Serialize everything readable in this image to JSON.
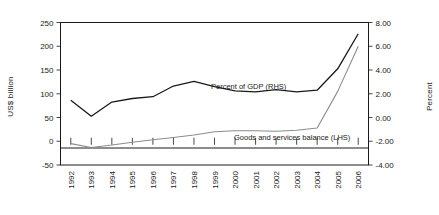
{
  "chart_data": {
    "type": "line",
    "title": "",
    "xlabel": "",
    "ylabel": "US$ billion",
    "ylabel_right": "Percent",
    "grid": false,
    "legend_position": "inline-annotation",
    "x": [
      1992,
      1993,
      1994,
      1995,
      1996,
      1997,
      1998,
      1999,
      2000,
      2001,
      2002,
      2003,
      2004,
      2005,
      2006
    ],
    "categories": [
      "1992",
      "1993",
      "1994",
      "1995",
      "1996",
      "1997",
      "1998",
      "1999",
      "2000",
      "2001",
      "2002",
      "2003",
      "2004",
      "2005",
      "2006"
    ],
    "ylim": [
      -50,
      250
    ],
    "yticks": [
      -50,
      0,
      50,
      100,
      150,
      200,
      250
    ],
    "ytick_labels": [
      "-50",
      "0",
      "50",
      "100",
      "150",
      "200",
      "250"
    ],
    "ylim_right": [
      -4.0,
      8.0
    ],
    "yticks_right": [
      -4.0,
      -2.0,
      0.0,
      2.0,
      4.0,
      6.0,
      8.0
    ],
    "ytick_labels_right": [
      "-4.00",
      "-2.00",
      "0.00",
      "2.00",
      "4.00",
      "6.00",
      "8.00"
    ],
    "series": [
      {
        "name": "Percent of GDP (RHS)",
        "axis": "right",
        "color": "#1a1a1a",
        "annotation": "Percent of GDP (RHS)",
        "values": [
          1.45,
          0.1,
          1.3,
          1.6,
          1.75,
          2.65,
          3.05,
          2.6,
          2.25,
          2.15,
          2.35,
          2.15,
          2.3,
          4.1,
          7.05
        ]
      },
      {
        "name": "Goods and services balance (LHS)",
        "axis": "left",
        "color": "#8c8c8c",
        "annotation": "Goods and services balance (LHS)",
        "values": [
          -5,
          -13,
          -8,
          -2,
          3,
          8,
          13,
          20,
          22,
          22,
          21,
          23,
          28,
          105,
          200
        ]
      }
    ],
    "annotations": [
      {
        "text": "Percent of GDP (RHS)",
        "x_px": 211,
        "y_px": 89
      },
      {
        "text": "Goods and services balance (LHS)",
        "x_px": 234,
        "y_px": 140
      }
    ]
  },
  "axis": {
    "left_title": "US$ billion",
    "right_title": "Percent"
  }
}
